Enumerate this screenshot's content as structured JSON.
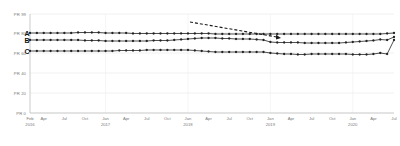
{
  "chart_data": {
    "type": "line",
    "title": "",
    "subtitle": "",
    "xlabel": "",
    "ylabel": "",
    "ylim": [
      0,
      99
    ],
    "grid": true,
    "legend_position": "inline-left",
    "y_ticks": [
      {
        "value": 99,
        "label": "PR 99"
      },
      {
        "value": 80,
        "label": "PR 80"
      },
      {
        "value": 60,
        "label": "PR 60"
      },
      {
        "value": 40,
        "label": "PR 40"
      },
      {
        "value": 20,
        "label": "PR 20"
      },
      {
        "value": 0,
        "label": "PR 0"
      }
    ],
    "x_ticks": [
      {
        "index": 0,
        "label": "Feb",
        "year": "2016"
      },
      {
        "index": 2,
        "label": "Apr",
        "year": ""
      },
      {
        "index": 5,
        "label": "Jul",
        "year": ""
      },
      {
        "index": 8,
        "label": "Oct",
        "year": ""
      },
      {
        "index": 11,
        "label": "Jan",
        "year": "2017"
      },
      {
        "index": 14,
        "label": "Apr",
        "year": ""
      },
      {
        "index": 17,
        "label": "Jul",
        "year": ""
      },
      {
        "index": 20,
        "label": "Oct",
        "year": ""
      },
      {
        "index": 23,
        "label": "Jan",
        "year": "2018"
      },
      {
        "index": 26,
        "label": "Apr",
        "year": ""
      },
      {
        "index": 29,
        "label": "Jul",
        "year": ""
      },
      {
        "index": 32,
        "label": "Oct",
        "year": ""
      },
      {
        "index": 35,
        "label": "Jan",
        "year": "2019"
      },
      {
        "index": 38,
        "label": "Apr",
        "year": ""
      },
      {
        "index": 41,
        "label": "Jul",
        "year": ""
      },
      {
        "index": 44,
        "label": "Oct",
        "year": ""
      },
      {
        "index": 47,
        "label": "Jan",
        "year": "2020"
      },
      {
        "index": 50,
        "label": "Apr",
        "year": ""
      },
      {
        "index": 53,
        "label": "Jul",
        "year": ""
      }
    ],
    "x_count": 54,
    "marker": "circle",
    "series": [
      {
        "name": "A",
        "label": "A",
        "color": "#222222",
        "values": [
          80,
          80,
          80,
          80,
          80,
          80,
          80,
          80.5,
          80.5,
          80.5,
          80.5,
          80,
          80,
          80,
          80,
          79.5,
          79.5,
          79.5,
          79.5,
          79.5,
          79.5,
          79.5,
          79.5,
          79.5,
          79.5,
          79.5,
          79.5,
          79,
          79,
          79,
          79,
          79,
          79,
          79,
          79,
          79,
          79,
          79,
          79,
          79,
          79,
          79,
          79,
          79,
          79,
          79,
          79,
          79,
          79,
          79,
          79,
          79,
          79.5,
          80
        ]
      },
      {
        "name": "B",
        "label": "B",
        "color": "#222222",
        "values": [
          73,
          73,
          73,
          73,
          73,
          73,
          73,
          73,
          72.5,
          72.5,
          72.5,
          72,
          72,
          72,
          72,
          72,
          72,
          72,
          72.5,
          72.5,
          72.5,
          73,
          73.5,
          74,
          74.5,
          75,
          75,
          75,
          74.5,
          74.5,
          74,
          74,
          74,
          73.5,
          73,
          71,
          70.5,
          70.5,
          70.5,
          70.5,
          70,
          70,
          70,
          70,
          70,
          70,
          70.5,
          71,
          71.5,
          72,
          72.5,
          73.5,
          73,
          76
        ]
      },
      {
        "name": "C",
        "label": "C",
        "color": "#222222",
        "values": [
          62,
          62,
          62,
          62,
          62,
          62,
          62,
          62,
          62,
          62,
          62,
          62,
          62,
          62.5,
          62.5,
          62.5,
          62.5,
          63,
          63,
          63,
          63,
          63,
          63,
          63,
          62.5,
          62,
          61.5,
          61,
          61,
          61,
          61,
          61,
          61,
          61,
          61,
          60,
          59.5,
          59,
          59,
          58.5,
          58.5,
          59,
          59,
          59,
          59,
          59,
          59,
          58.5,
          58.5,
          58.5,
          59,
          60,
          59,
          73
        ]
      }
    ],
    "annotations": [
      {
        "type": "arrow",
        "style": "dashed",
        "x_start": 190,
        "y_start": 22,
        "x_end": 281,
        "y_end": 38
      }
    ]
  }
}
